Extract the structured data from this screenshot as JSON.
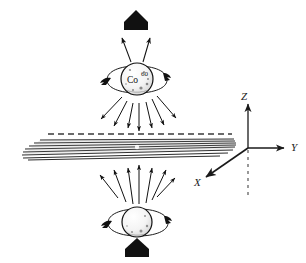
{
  "figure": {
    "background_color": "#ffffff",
    "ink_color": "#111111",
    "width": 306,
    "height": 263
  },
  "labels": {
    "axis_z": "Z",
    "axis_y": "Y",
    "axis_x": "X",
    "nuclide_symbol": "Co",
    "nuclide_mass_number": "60"
  },
  "elements": {
    "top_source_name": "cobalt-60-source-top",
    "bottom_source_name": "cobalt-60-source-bottom",
    "slab_name": "detector-plane-slab",
    "top_block_arrow": "spin-direction-arrow-up-top",
    "bottom_block_arrow": "spin-direction-arrow-up-bottom"
  },
  "geometry": {
    "axes_origin": [
      248,
      148
    ],
    "z_axis_tip": [
      248,
      106
    ],
    "y_axis_tip": [
      286,
      148
    ],
    "x_axis_tip": [
      205,
      178
    ],
    "neg_z_dashed_end": [
      248,
      196
    ],
    "slab_left_x": 22,
    "slab_right_x": 236,
    "slab_center_y": 148,
    "top_sphere_center": [
      137,
      79
    ],
    "top_sphere_radius": 16,
    "bottom_sphere_center": [
      137,
      222
    ],
    "bottom_sphere_radius": 15
  },
  "counts": {
    "emission_arrows_below_top_source": 7,
    "emission_arrows_above_bottom_source": 7,
    "emission_arrows_above_top_source": 2,
    "slab_lines": 9
  }
}
